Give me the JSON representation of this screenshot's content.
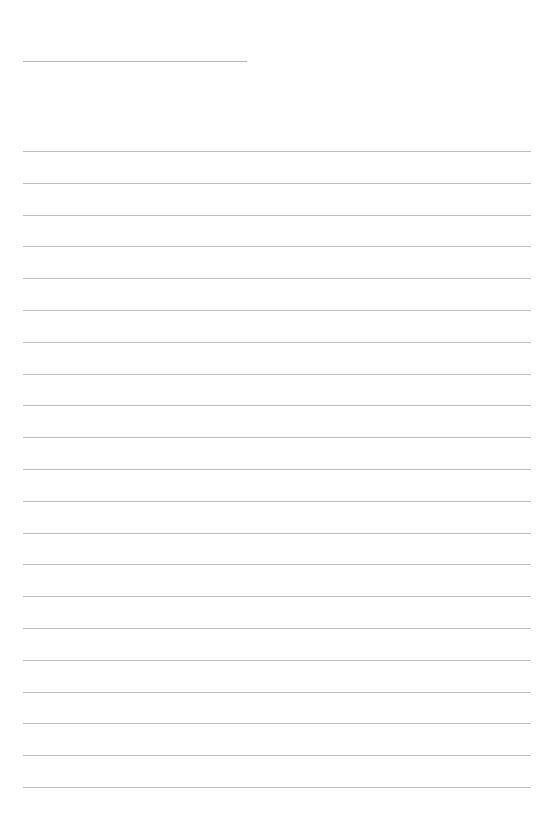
{
  "document": {
    "type": "lined-paper",
    "title_line": {
      "text": "",
      "left": 23,
      "top": 61,
      "width": 224
    },
    "writing_area": {
      "left": 23,
      "width": 508,
      "line_color": "#bdbdbd",
      "first_line_top": 151,
      "line_spacing": 31.8,
      "line_count": 21
    },
    "lines": [
      {
        "text": ""
      },
      {
        "text": ""
      },
      {
        "text": ""
      },
      {
        "text": ""
      },
      {
        "text": ""
      },
      {
        "text": ""
      },
      {
        "text": ""
      },
      {
        "text": ""
      },
      {
        "text": ""
      },
      {
        "text": ""
      },
      {
        "text": ""
      },
      {
        "text": ""
      },
      {
        "text": ""
      },
      {
        "text": ""
      },
      {
        "text": ""
      },
      {
        "text": ""
      },
      {
        "text": ""
      },
      {
        "text": ""
      },
      {
        "text": ""
      },
      {
        "text": ""
      },
      {
        "text": ""
      }
    ]
  }
}
